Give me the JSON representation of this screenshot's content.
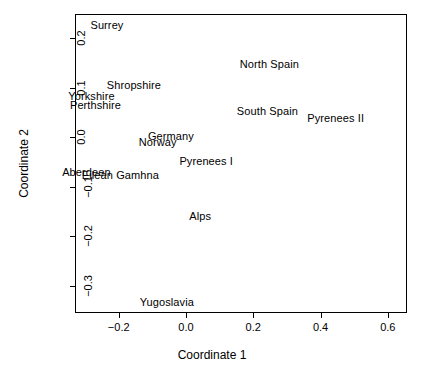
{
  "chart_data": {
    "type": "scatter",
    "title": "",
    "subtitle": "",
    "xlabel": "Coordinate 1",
    "ylabel": "Coordinate 2",
    "xlim": [
      -0.33,
      0.657
    ],
    "ylim": [
      -0.355,
      0.2495
    ],
    "xticks": [
      -0.2,
      0.0,
      0.2,
      0.4,
      0.6
    ],
    "xticklabels": [
      "-0.2",
      "0.0",
      "0.2",
      "0.4",
      "0.6"
    ],
    "yticks": [
      0.2,
      0.1,
      0.0,
      -0.1,
      -0.2,
      -0.3
    ],
    "yticklabels": [
      "0.2",
      "0.1",
      "0.0",
      "-0.1",
      "-0.2",
      "-0.3"
    ],
    "grid": false,
    "legend": false,
    "legend_position": "none",
    "marker": "text-label",
    "labels": [
      "Surrey",
      "North Spain",
      "Shropshire",
      "Yorkshire",
      "Perthshire",
      "South Spain",
      "Pyrenees II",
      "Germany",
      "Norway",
      "Pyrenees I",
      "Aberdeen",
      "Eilean Gamhna",
      "Alps",
      "Yugoslavia"
    ],
    "x": [
      -0.235,
      0.248,
      -0.155,
      -0.281,
      -0.269,
      0.242,
      0.445,
      -0.045,
      -0.084,
      0.06,
      -0.296,
      -0.195,
      0.042,
      -0.057
    ],
    "y": [
      0.227,
      0.148,
      0.105,
      0.083,
      0.065,
      0.053,
      0.04,
      0.002,
      -0.01,
      -0.048,
      -0.069,
      -0.077,
      -0.158,
      -0.333
    ],
    "points": [
      {
        "label": "Surrey",
        "x": -0.235,
        "y": 0.227
      },
      {
        "label": "North Spain",
        "x": 0.248,
        "y": 0.148
      },
      {
        "label": "Shropshire",
        "x": -0.155,
        "y": 0.105
      },
      {
        "label": "Yorkshire",
        "x": -0.281,
        "y": 0.083
      },
      {
        "label": "Perthshire",
        "x": -0.269,
        "y": 0.065
      },
      {
        "label": "South Spain",
        "x": 0.242,
        "y": 0.053
      },
      {
        "label": "Pyrenees II",
        "x": 0.445,
        "y": 0.04
      },
      {
        "label": "Germany",
        "x": -0.045,
        "y": 0.002
      },
      {
        "label": "Norway",
        "x": -0.084,
        "y": -0.01
      },
      {
        "label": "Pyrenees I",
        "x": 0.06,
        "y": -0.048
      },
      {
        "label": "Aberdeen",
        "x": -0.296,
        "y": -0.069
      },
      {
        "label": "Eilean Gamhna",
        "x": -0.195,
        "y": -0.077
      },
      {
        "label": "Alps",
        "x": 0.042,
        "y": -0.158
      },
      {
        "label": "Yugoslavia",
        "x": -0.057,
        "y": -0.333
      }
    ]
  },
  "colors": {
    "background": "#ffffff",
    "foreground": "#000000",
    "axis": "#000000"
  }
}
